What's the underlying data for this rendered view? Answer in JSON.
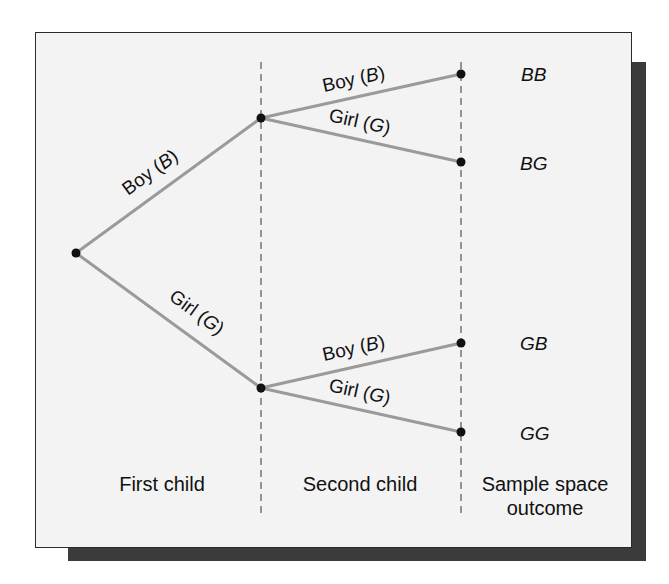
{
  "diagram": {
    "type": "tree-diagram",
    "title": "",
    "columns": [
      {
        "label": "First child"
      },
      {
        "label": "Second child"
      },
      {
        "label_line1": "Sample space",
        "label_line2": "outcome"
      }
    ],
    "branches": {
      "level1": [
        {
          "word": "Boy (",
          "letter": "B",
          "close": ")"
        },
        {
          "word": "Girl (",
          "letter": "G",
          "close": ")"
        }
      ],
      "level2_upper": [
        {
          "word": "Boy (",
          "letter": "B",
          "close": ")"
        },
        {
          "word": "Girl (",
          "letter": "G",
          "close": ")"
        }
      ],
      "level2_lower": [
        {
          "word": "Boy (",
          "letter": "B",
          "close": ")"
        },
        {
          "word": "Girl (",
          "letter": "G",
          "close": ")"
        }
      ]
    },
    "outcomes": [
      "BB",
      "BG",
      "GB",
      "GG"
    ],
    "colors": {
      "branch": "#9a9a9a",
      "node": "#111111",
      "dash": "#555555",
      "panel_bg": "#f3f3f3",
      "shadow": "#3b3b3b"
    }
  }
}
